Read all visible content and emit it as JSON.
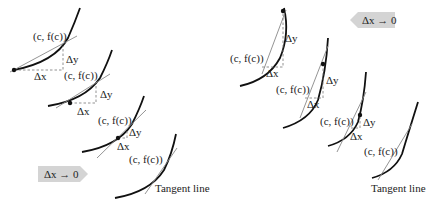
{
  "diagram": {
    "point_label": "(c, f(c))",
    "delta_x_label": "Δx",
    "delta_y_label": "Δy",
    "tangent_label": "Tangent line",
    "limit_label": "Δx → 0",
    "left_panel": {
      "direction": "Δx positive (point to the right)",
      "arrow_direction": "right",
      "frames": 4
    },
    "right_panel": {
      "direction": "Δx negative (point to the left)",
      "arrow_direction": "left",
      "frames": 4
    }
  }
}
